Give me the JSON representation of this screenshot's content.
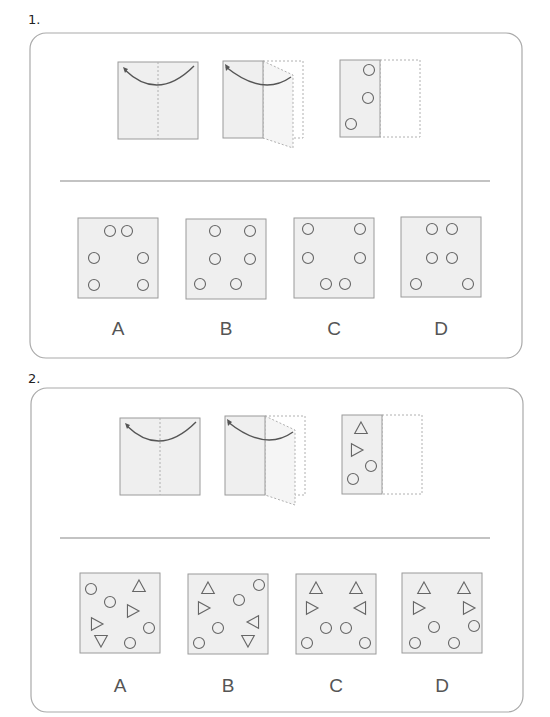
{
  "questions": [
    {
      "number": "1.",
      "number_pos": [
        28,
        12
      ],
      "frame": {
        "x": 30,
        "y": 33,
        "w": 492,
        "h": 325,
        "r": 16
      },
      "divider": {
        "x1": 60,
        "x2": 490,
        "y": 181
      },
      "fold_steps": {
        "step1": {
          "x": 118,
          "y": 62,
          "w": 80,
          "h": 77
        },
        "step2": {
          "x": 223,
          "y": 61,
          "w": 40,
          "h": 77,
          "flap_w": 40
        },
        "unfolded": {
          "x": 340,
          "y": 60,
          "w": 40,
          "h": 77,
          "shapes": [
            {
              "t": "c",
              "x": 369,
              "y": 70
            },
            {
              "t": "c",
              "x": 368,
              "y": 98
            },
            {
              "t": "c",
              "x": 351,
              "y": 124
            }
          ]
        }
      },
      "options": [
        {
          "label": "A",
          "x": 78,
          "y": 218,
          "shapes": [
            {
              "t": "c",
              "x": 110,
              "y": 231
            },
            {
              "t": "c",
              "x": 127,
              "y": 231
            },
            {
              "t": "c",
              "x": 94,
              "y": 258
            },
            {
              "t": "c",
              "x": 143,
              "y": 258
            },
            {
              "t": "c",
              "x": 94,
              "y": 285
            },
            {
              "t": "c",
              "x": 143,
              "y": 285
            }
          ]
        },
        {
          "label": "B",
          "x": 186,
          "y": 219,
          "shapes": [
            {
              "t": "c",
              "x": 215,
              "y": 231
            },
            {
              "t": "c",
              "x": 250,
              "y": 231
            },
            {
              "t": "c",
              "x": 215,
              "y": 259
            },
            {
              "t": "c",
              "x": 250,
              "y": 259
            },
            {
              "t": "c",
              "x": 200,
              "y": 284
            },
            {
              "t": "c",
              "x": 236,
              "y": 284
            }
          ]
        },
        {
          "label": "C",
          "x": 294,
          "y": 218,
          "shapes": [
            {
              "t": "c",
              "x": 308,
              "y": 229
            },
            {
              "t": "c",
              "x": 360,
              "y": 229
            },
            {
              "t": "c",
              "x": 308,
              "y": 258
            },
            {
              "t": "c",
              "x": 360,
              "y": 258
            },
            {
              "t": "c",
              "x": 326,
              "y": 284
            },
            {
              "t": "c",
              "x": 345,
              "y": 284
            }
          ]
        },
        {
          "label": "D",
          "x": 401,
          "y": 217,
          "shapes": [
            {
              "t": "c",
              "x": 432,
              "y": 229
            },
            {
              "t": "c",
              "x": 452,
              "y": 229
            },
            {
              "t": "c",
              "x": 432,
              "y": 258
            },
            {
              "t": "c",
              "x": 452,
              "y": 258
            },
            {
              "t": "c",
              "x": 416,
              "y": 284
            },
            {
              "t": "c",
              "x": 468,
              "y": 284
            }
          ]
        }
      ],
      "labels_y": 318
    },
    {
      "number": "2.",
      "number_pos": [
        28,
        371
      ],
      "frame": {
        "x": 31,
        "y": 388,
        "w": 492,
        "h": 324,
        "r": 16
      },
      "divider": {
        "x1": 60,
        "x2": 490,
        "y": 538
      },
      "fold_steps": {
        "step1": {
          "x": 120,
          "y": 418,
          "w": 80,
          "h": 77
        },
        "step2": {
          "x": 225,
          "y": 416,
          "w": 40,
          "h": 79,
          "flap_w": 40
        },
        "unfolded": {
          "x": 342,
          "y": 415,
          "w": 40,
          "h": 79,
          "shapes": [
            {
              "t": "tu",
              "x": 361,
              "y": 429
            },
            {
              "t": "tr",
              "x": 356,
              "y": 450
            },
            {
              "t": "c",
              "x": 371,
              "y": 466
            },
            {
              "t": "c",
              "x": 353,
              "y": 479
            }
          ]
        }
      },
      "options": [
        {
          "label": "A",
          "x": 80,
          "y": 573,
          "shapes": [
            {
              "t": "c",
              "x": 91,
              "y": 589
            },
            {
              "t": "tu",
              "x": 139,
              "y": 587
            },
            {
              "t": "c",
              "x": 110,
              "y": 602
            },
            {
              "t": "tr",
              "x": 132,
              "y": 611
            },
            {
              "t": "tr",
              "x": 96,
              "y": 624
            },
            {
              "t": "c",
              "x": 149,
              "y": 628
            },
            {
              "t": "td",
              "x": 101,
              "y": 640
            },
            {
              "t": "c",
              "x": 130,
              "y": 643
            }
          ]
        },
        {
          "label": "B",
          "x": 188,
          "y": 574,
          "shapes": [
            {
              "t": "tu",
              "x": 208,
              "y": 589
            },
            {
              "t": "c",
              "x": 259,
              "y": 585
            },
            {
              "t": "c",
              "x": 239,
              "y": 600
            },
            {
              "t": "tr",
              "x": 203,
              "y": 608
            },
            {
              "t": "tl",
              "x": 254,
              "y": 622
            },
            {
              "t": "c",
              "x": 218,
              "y": 628
            },
            {
              "t": "td",
              "x": 248,
              "y": 640
            },
            {
              "t": "c",
              "x": 199,
              "y": 643
            }
          ]
        },
        {
          "label": "C",
          "x": 296,
          "y": 574,
          "shapes": [
            {
              "t": "tu",
              "x": 316,
              "y": 589
            },
            {
              "t": "tu",
              "x": 356,
              "y": 589
            },
            {
              "t": "tr",
              "x": 311,
              "y": 608
            },
            {
              "t": "tl",
              "x": 361,
              "y": 608
            },
            {
              "t": "c",
              "x": 326,
              "y": 628
            },
            {
              "t": "c",
              "x": 346,
              "y": 628
            },
            {
              "t": "c",
              "x": 307,
              "y": 643
            },
            {
              "t": "c",
              "x": 365,
              "y": 643
            }
          ]
        },
        {
          "label": "D",
          "x": 402,
          "y": 573,
          "shapes": [
            {
              "t": "tu",
              "x": 424,
              "y": 589
            },
            {
              "t": "tu",
              "x": 464,
              "y": 589
            },
            {
              "t": "tr",
              "x": 418,
              "y": 608
            },
            {
              "t": "tr",
              "x": 468,
              "y": 608
            },
            {
              "t": "c",
              "x": 434,
              "y": 627
            },
            {
              "t": "c",
              "x": 474,
              "y": 626
            },
            {
              "t": "c",
              "x": 415,
              "y": 643
            },
            {
              "t": "c",
              "x": 454,
              "y": 643
            }
          ]
        }
      ],
      "labels_y": 675
    }
  ],
  "box_size": 80,
  "colors": {
    "paper_fill": "#efefef",
    "paper_stroke": "#9a9a9a",
    "shape_stroke": "#666666",
    "frame_stroke": "#aaaaaa",
    "divider": "#888888",
    "arrow": "#555555",
    "dotted": "#b0b0b0"
  }
}
